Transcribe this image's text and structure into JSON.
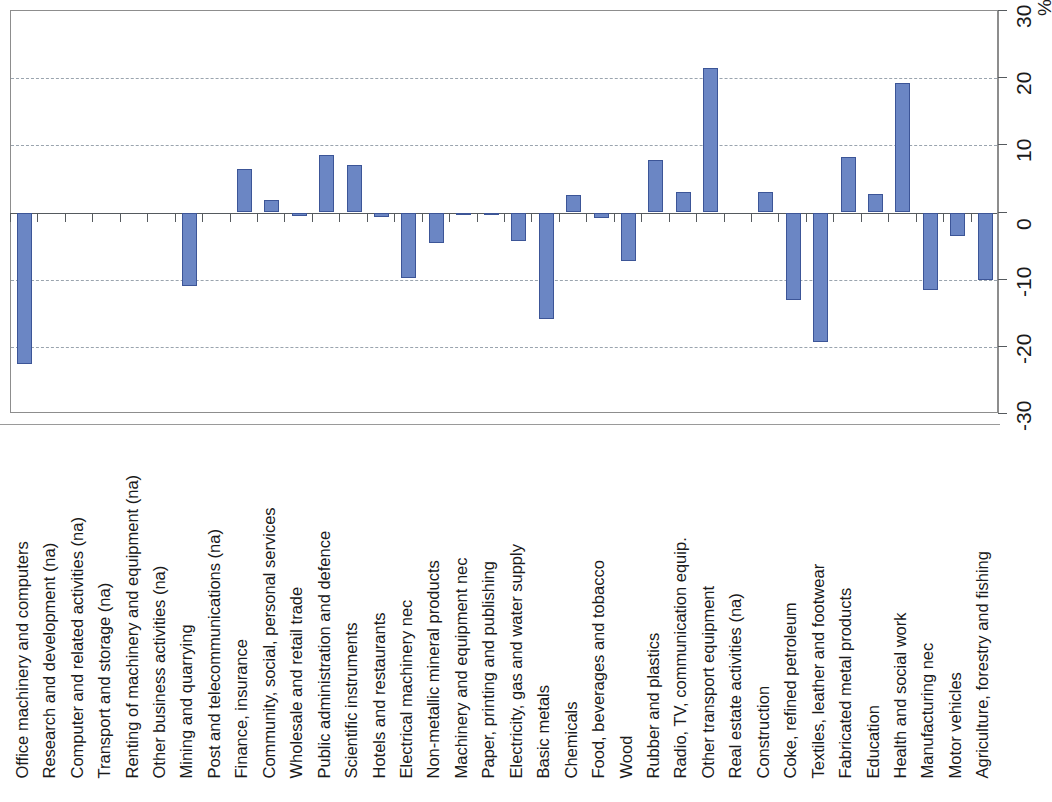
{
  "chart_data": {
    "type": "bar",
    "title": "",
    "subtitle": "",
    "xlabel": "",
    "ylabel": "%",
    "ylim": [
      -30,
      30
    ],
    "y_ticks": [
      30,
      20,
      10,
      0,
      -10,
      -20,
      -30
    ],
    "y_tick_labels": [
      "30",
      "20",
      "10",
      "0",
      "-10",
      "-20",
      "-30"
    ],
    "unit_label": "%",
    "gridlines": [
      20,
      10,
      -10,
      -20
    ],
    "grid": true,
    "legend": null,
    "legend_position": "none",
    "orientation": "vertical",
    "bar_color": "#6b86c4",
    "bar_edge_color": "#3c5597",
    "categories": [
      "Office machinery and computers",
      "Research and development (na)",
      "Computer and related activities (na)",
      "Transport and storage (na)",
      "Renting of machinery and equipment (na)",
      "Other business activities (na)",
      "Mining and quarrying",
      "Post and telecommunications (na)",
      "Finance, insurance",
      "Community, social, personal services",
      "Wholesale and retail trade",
      "Public administration and defence",
      "Scientific instruments",
      "Hotels and restaurants",
      "Electrical machinery nec",
      "Non-metallic mineral products",
      "Machinery and equipment nec",
      "Paper, printing and publishing",
      "Electricity, gas and water supply",
      "Basic metals",
      "Chemicals",
      "Food, beverages and tobacco",
      "Wood",
      "Rubber and plastics",
      "Radio, TV, communication equip.",
      "Other transport equipment",
      "Real estate activities (na)",
      "Construction",
      "Coke, refined petroleum",
      "Textiles, leather and footwear",
      "Fabricated metal products",
      "Education",
      "Health and social work",
      "Manufacturing nec",
      "Motor vehicles",
      "Agriculture, forestry and fishing"
    ],
    "values": [
      -22.5,
      null,
      null,
      null,
      null,
      null,
      -11.0,
      null,
      6.5,
      1.8,
      -0.5,
      8.5,
      7.0,
      -0.7,
      -9.7,
      -4.5,
      -0.4,
      -0.2,
      -4.2,
      -15.8,
      2.6,
      -0.8,
      -7.2,
      7.8,
      3.0,
      21.5,
      null,
      3.0,
      -13.0,
      -19.3,
      8.3,
      2.8,
      19.3,
      -11.5,
      -3.5,
      -10.0
    ]
  }
}
